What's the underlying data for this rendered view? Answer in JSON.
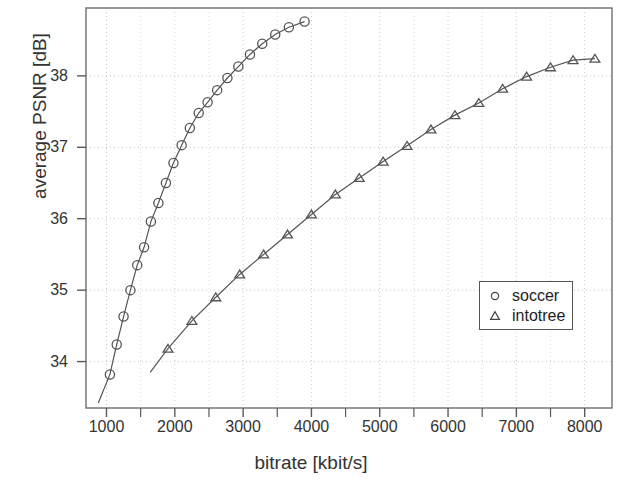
{
  "chart_data": {
    "type": "line",
    "title": "",
    "xlabel": "bitrate [kbit/s]",
    "ylabel": "average PSNR [dB]",
    "xlim": [
      700,
      8400
    ],
    "ylim": [
      33.35,
      38.95
    ],
    "xticks": [
      1000,
      2000,
      3000,
      4000,
      5000,
      6000,
      7000,
      8000
    ],
    "xtick_labels": [
      "1000",
      "2000",
      "3000",
      "4000",
      "5000",
      "6000",
      "7000",
      "8000"
    ],
    "xminor_step": 500,
    "yticks": [
      34,
      35,
      36,
      37,
      38
    ],
    "ytick_labels": [
      "34",
      "35",
      "36",
      "37",
      "38"
    ],
    "grid": true,
    "grid_style": "dotted",
    "legend_position": "center-right",
    "series": [
      {
        "name": "soccer",
        "marker": "circle",
        "color": "#555555",
        "points": [
          [
            1050,
            33.82
          ],
          [
            1150,
            34.24
          ],
          [
            1250,
            34.63
          ],
          [
            1350,
            35.0
          ],
          [
            1450,
            35.35
          ],
          [
            1550,
            35.6
          ],
          [
            1650,
            35.96
          ],
          [
            1760,
            36.22
          ],
          [
            1870,
            36.5
          ],
          [
            1980,
            36.78
          ],
          [
            2100,
            37.03
          ],
          [
            2220,
            37.27
          ],
          [
            2350,
            37.48
          ],
          [
            2480,
            37.63
          ],
          [
            2620,
            37.8
          ],
          [
            2770,
            37.97
          ],
          [
            2930,
            38.13
          ],
          [
            3100,
            38.3
          ],
          [
            3280,
            38.45
          ],
          [
            3470,
            38.58
          ],
          [
            3670,
            38.68
          ],
          [
            3900,
            38.76
          ]
        ],
        "line_extension_start": [
          880,
          33.42
        ]
      },
      {
        "name": "intotree",
        "marker": "triangle",
        "color": "#555555",
        "points": [
          [
            1900,
            34.18
          ],
          [
            2250,
            34.57
          ],
          [
            2600,
            34.9
          ],
          [
            2950,
            35.22
          ],
          [
            3300,
            35.5
          ],
          [
            3650,
            35.78
          ],
          [
            4000,
            36.06
          ],
          [
            4350,
            36.34
          ],
          [
            4700,
            36.57
          ],
          [
            5050,
            36.8
          ],
          [
            5400,
            37.02
          ],
          [
            5750,
            37.25
          ],
          [
            6100,
            37.45
          ],
          [
            6450,
            37.62
          ],
          [
            6800,
            37.82
          ],
          [
            7150,
            37.99
          ],
          [
            7500,
            38.12
          ],
          [
            7830,
            38.22
          ],
          [
            8150,
            38.24
          ]
        ],
        "line_extension_start": [
          1640,
          33.85
        ]
      }
    ]
  },
  "legend": {
    "entries": [
      {
        "label": "soccer",
        "marker": "circle"
      },
      {
        "label": "intotree",
        "marker": "triangle"
      }
    ]
  }
}
